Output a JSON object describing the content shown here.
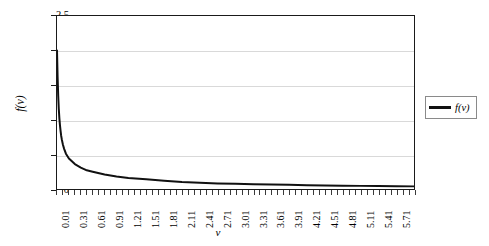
{
  "chart_data": {
    "type": "line",
    "title": "",
    "xlabel": "v",
    "ylabel": "f(v)",
    "xlim": [
      0.01,
      6.01
    ],
    "ylim": [
      0,
      2.5
    ],
    "grid": true,
    "legend_position": "right",
    "y_ticks": [
      "0",
      "0.5",
      "1",
      "1.5",
      "2",
      "2.5"
    ],
    "y_tick_values": [
      0,
      0.5,
      1,
      1.5,
      2,
      2.5
    ],
    "x_ticks": [
      "0.01",
      "0.31",
      "0.61",
      "0.91",
      "1.21",
      "1.51",
      "1.81",
      "2.11",
      "2.41",
      "2.71",
      "3.01",
      "3.31",
      "3.61",
      "3.91",
      "4.21",
      "4.51",
      "4.81",
      "5.11",
      "5.41",
      "5.71"
    ],
    "x_tick_values": [
      0.01,
      0.31,
      0.61,
      0.91,
      1.21,
      1.51,
      1.81,
      2.11,
      2.41,
      2.71,
      3.01,
      3.31,
      3.61,
      3.91,
      4.21,
      4.51,
      4.81,
      5.11,
      5.41,
      5.71
    ],
    "series": [
      {
        "name": "f(v)",
        "color": "#111111",
        "x": [
          0.01,
          0.02,
          0.03,
          0.04,
          0.05,
          0.06,
          0.07,
          0.08,
          0.09,
          0.11,
          0.13,
          0.16,
          0.21,
          0.31,
          0.41,
          0.51,
          0.61,
          0.81,
          1.01,
          1.21,
          1.51,
          1.81,
          2.11,
          2.41,
          2.71,
          3.01,
          3.31,
          3.61,
          3.91,
          4.21,
          4.51,
          4.81,
          5.11,
          5.41,
          5.71,
          6.01
        ],
        "y": [
          2.0,
          1.62,
          1.35,
          1.16,
          1.02,
          0.92,
          0.84,
          0.77,
          0.72,
          0.64,
          0.58,
          0.51,
          0.44,
          0.36,
          0.31,
          0.27,
          0.25,
          0.21,
          0.18,
          0.16,
          0.14,
          0.12,
          0.1,
          0.09,
          0.08,
          0.075,
          0.07,
          0.065,
          0.06,
          0.055,
          0.05,
          0.048,
          0.045,
          0.042,
          0.04,
          0.038
        ]
      }
    ],
    "legend": [
      {
        "label": "f(v)",
        "color": "#111111"
      }
    ]
  }
}
